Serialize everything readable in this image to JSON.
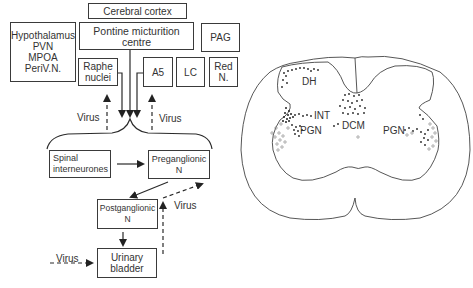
{
  "left_diagram": {
    "boxes": {
      "cerebral_cortex": "Cerebral cortex",
      "hypothalamus": "Hypothalamus\nPVN\nMPOA\nPeriV.N.",
      "pontine": "Pontine micturition\ncentre",
      "pag": "PAG",
      "raphe": "Raphe\nnuclei",
      "a5": "A5",
      "lc": "LC",
      "red_n": "Red\nN.",
      "spinal_interneurones": "Spinal\ninterneurones",
      "preganglionic": "Preganglionic\nN",
      "postganglionic": "Postganglionic\nN",
      "urinary_bladder": "Urinary\nbladder"
    },
    "virus_labels": [
      "Virus",
      "Virus",
      "Virus",
      "Virus"
    ]
  },
  "spinal_section": {
    "labels": {
      "dh": "DH",
      "int": "INT",
      "pgn_left": "PGN",
      "dcm": "DCM",
      "pgn_right": "PGN"
    }
  },
  "colors": {
    "line": "#3a3a3a",
    "background": "#ffffff"
  }
}
